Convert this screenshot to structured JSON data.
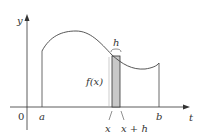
{
  "diagram": {
    "colors": {
      "axis": "#333333",
      "curve": "#444444",
      "strip_fill": "#c8c8c8",
      "background": "#ffffff"
    },
    "labels": {
      "y_axis": "y",
      "t_axis": "t",
      "origin": "0",
      "a": "a",
      "b": "b",
      "x": "x",
      "x_plus_h": "x + h",
      "h": "h",
      "f_of_x": "f(x)"
    }
  }
}
